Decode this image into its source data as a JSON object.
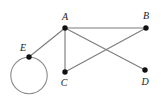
{
  "figure": {
    "background_color": "#ffffff",
    "edge_color": "#7d7d7d",
    "loop_color": "#8a8a8a",
    "vertex_color": "#111111",
    "label_color": "#1a1a1a",
    "width": 161,
    "height": 109
  },
  "graph": {
    "vertices": [
      {
        "id": "A",
        "label": "A",
        "x": 65,
        "y": 28,
        "label_x": 65,
        "label_y": 20,
        "radius": 2.6
      },
      {
        "id": "B",
        "label": "B",
        "x": 146,
        "y": 28,
        "label_x": 146,
        "label_y": 19,
        "radius": 2.6
      },
      {
        "id": "C",
        "label": "C",
        "x": 65,
        "y": 72,
        "label_x": 64,
        "label_y": 86,
        "radius": 2.6
      },
      {
        "id": "D",
        "label": "D",
        "x": 145,
        "y": 70,
        "label_x": 145,
        "label_y": 85,
        "radius": 2.6
      },
      {
        "id": "E",
        "label": "E",
        "x": 29,
        "y": 57,
        "label_x": 23,
        "label_y": 51,
        "radius": 2.6
      }
    ],
    "edges": [
      {
        "from": "A",
        "to": "B",
        "x1": 65,
        "y1": 28,
        "x2": 146,
        "y2": 28
      },
      {
        "from": "A",
        "to": "C",
        "x1": 65,
        "y1": 28,
        "x2": 65,
        "y2": 72
      },
      {
        "from": "A",
        "to": "D",
        "x1": 65,
        "y1": 28,
        "x2": 145,
        "y2": 70
      },
      {
        "from": "A",
        "to": "E",
        "x1": 65,
        "y1": 28,
        "x2": 29,
        "y2": 57
      },
      {
        "from": "C",
        "to": "B",
        "x1": 65,
        "y1": 72,
        "x2": 146,
        "y2": 28
      }
    ],
    "loops": [
      {
        "at": "E",
        "cx": 29,
        "cy": 75.5,
        "r": 18.2
      }
    ]
  }
}
